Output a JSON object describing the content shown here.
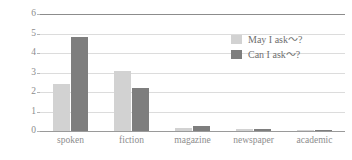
{
  "chart_data": {
    "type": "bar",
    "title": "",
    "subtitle": "",
    "xlabel": "",
    "ylabel": "",
    "ylim": [
      0,
      6
    ],
    "yticks": [
      0,
      1,
      2,
      3,
      4,
      5,
      6
    ],
    "ytick_labels": [
      "0",
      "1",
      "2",
      "3",
      "4",
      "5",
      "6"
    ],
    "grid": true,
    "legend_position": "upper-right",
    "categories": [
      "spoken",
      "fiction",
      "magazine",
      "newspaper",
      "academic"
    ],
    "series": [
      {
        "name": "May I ask〜?",
        "color": "#d2d2d2",
        "values": [
          2.4,
          3.1,
          0.15,
          0.1,
          0.03
        ]
      },
      {
        "name": "Can I ask〜?",
        "color": "#7e7e7e",
        "values": [
          4.8,
          2.2,
          0.28,
          0.08,
          0.05
        ]
      }
    ]
  },
  "legend": {
    "items": [
      {
        "label": "May I ask〜?",
        "swatch": "#d2d2d2"
      },
      {
        "label": "Can I ask〜?",
        "swatch": "#7e7e7e"
      }
    ]
  },
  "axes": {
    "y": {
      "labels": [
        "6",
        "5",
        "4",
        "3",
        "2",
        "1",
        "0"
      ]
    },
    "x": {
      "labels": [
        "spoken",
        "fiction",
        "magazine",
        "newspaper",
        "academic"
      ]
    }
  },
  "colors": {
    "series_light": "#d2d2d2",
    "series_dark": "#7e7e7e",
    "gridline": "#dcdcdc",
    "axis": "#8c8c8c",
    "text": "#8d8d8d",
    "background": "#ffffff"
  }
}
